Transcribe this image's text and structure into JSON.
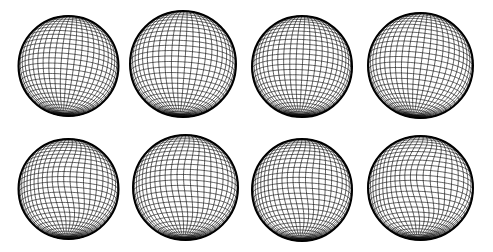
{
  "figure": {
    "width": 493,
    "height": 252,
    "background": "#ffffff",
    "line_color": "#111111",
    "rim_color": "#000000",
    "grid": {
      "latitude_lines": 30,
      "longitude_lines": 48
    },
    "rows": [
      {
        "name": "top-row",
        "style": "regular",
        "spheres": [
          {
            "id": "sphere-1",
            "cx": 68.5,
            "cy": 66,
            "rx": 50,
            "ry": 50,
            "tilt": 0.1,
            "yaw": 0.0,
            "warp": 0
          },
          {
            "id": "sphere-2",
            "cx": 183,
            "cy": 64,
            "rx": 53,
            "ry": 53,
            "tilt": 0.06,
            "yaw": 0.05,
            "warp": 0
          },
          {
            "id": "sphere-3",
            "cx": 302,
            "cy": 66.5,
            "rx": 50,
            "ry": 50.5,
            "tilt": 0.05,
            "yaw": 0.02,
            "warp": 0
          },
          {
            "id": "sphere-4",
            "cx": 420.5,
            "cy": 65.5,
            "rx": 52.5,
            "ry": 52.5,
            "tilt": 0.12,
            "yaw": 0.04,
            "warp": 0
          }
        ]
      },
      {
        "name": "bottom-row",
        "style": "deformed",
        "spheres": [
          {
            "id": "sphere-5",
            "cx": 68.5,
            "cy": 189,
            "rx": 50,
            "ry": 50,
            "tilt": 0.03,
            "yaw": 0.0,
            "warp": 0.1
          },
          {
            "id": "sphere-6",
            "cx": 185.5,
            "cy": 187.5,
            "rx": 52.5,
            "ry": 52.5,
            "tilt": 0.02,
            "yaw": 0.03,
            "warp": 0.07
          },
          {
            "id": "sphere-7",
            "cx": 302,
            "cy": 190,
            "rx": 50,
            "ry": 51,
            "tilt": 0.02,
            "yaw": 0.02,
            "warp": 0.08
          },
          {
            "id": "sphere-8",
            "cx": 420.5,
            "cy": 188,
            "rx": 52.5,
            "ry": 52,
            "tilt": 0.04,
            "yaw": 0.05,
            "warp": 0.13
          }
        ]
      }
    ]
  }
}
